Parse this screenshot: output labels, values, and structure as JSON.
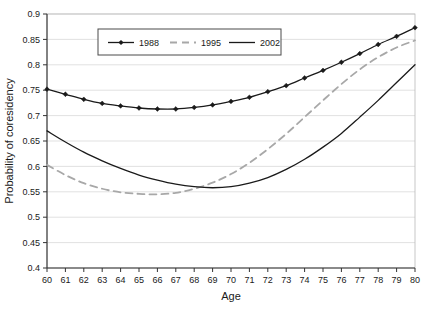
{
  "figure": {
    "title": "",
    "background_color": "#ffffff"
  },
  "axes": {
    "x_title": "Age",
    "y_title": "Probability of coresidency",
    "x_ticks": [
      "60",
      "61",
      "62",
      "63",
      "64",
      "65",
      "66",
      "67",
      "68",
      "69",
      "70",
      "71",
      "72",
      "73",
      "74",
      "75",
      "76",
      "77",
      "78",
      "79",
      "80"
    ],
    "y_ticks": [
      "0.4",
      "0.45",
      "0.5",
      "0.55",
      "0.6",
      "0.65",
      "0.7",
      "0.75",
      "0.8",
      "0.85",
      "0.9"
    ]
  },
  "legend": {
    "items": [
      {
        "label": "1988",
        "style": "line-markers",
        "color": "#1a1a1a"
      },
      {
        "label": "1995",
        "style": "dashed",
        "color": "#a8a8a8"
      },
      {
        "label": "2002",
        "style": "solid",
        "color": "#1a1a1a"
      }
    ]
  },
  "chart_data": {
    "type": "line",
    "title": "",
    "xlabel": "Age",
    "ylabel": "Probability of coresidency",
    "xlim": [
      60,
      80
    ],
    "ylim": [
      0.4,
      0.9
    ],
    "grid": true,
    "legend_position": "top-center-inside",
    "x": [
      60,
      61,
      62,
      63,
      64,
      65,
      66,
      67,
      68,
      69,
      70,
      71,
      72,
      73,
      74,
      75,
      76,
      77,
      78,
      79,
      80
    ],
    "series": [
      {
        "name": "1988",
        "color": "#1a1a1a",
        "style": "solid",
        "markers": "diamond",
        "values": [
          0.752,
          0.742,
          0.732,
          0.724,
          0.719,
          0.715,
          0.713,
          0.713,
          0.716,
          0.721,
          0.728,
          0.736,
          0.747,
          0.759,
          0.774,
          0.789,
          0.805,
          0.822,
          0.84,
          0.856,
          0.873
        ]
      },
      {
        "name": "1995",
        "color": "#a8a8a8",
        "style": "dashed",
        "markers": "none",
        "values": [
          0.603,
          0.583,
          0.567,
          0.556,
          0.549,
          0.546,
          0.545,
          0.548,
          0.556,
          0.568,
          0.585,
          0.607,
          0.634,
          0.664,
          0.697,
          0.73,
          0.762,
          0.791,
          0.815,
          0.834,
          0.848
        ]
      },
      {
        "name": "2002",
        "color": "#1a1a1a",
        "style": "solid",
        "markers": "none",
        "values": [
          0.67,
          0.648,
          0.628,
          0.611,
          0.596,
          0.583,
          0.573,
          0.565,
          0.56,
          0.558,
          0.56,
          0.567,
          0.578,
          0.594,
          0.614,
          0.638,
          0.665,
          0.697,
          0.73,
          0.765,
          0.8
        ]
      }
    ]
  }
}
